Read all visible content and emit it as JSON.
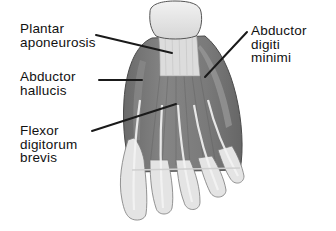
{
  "diagram": {
    "colors": {
      "muscle": "#7a7a7a",
      "muscle_dark": "#5e5e5e",
      "tendon": "#e6e6e6",
      "outline": "#4a4a4a",
      "leader_line": "#1a1a1a",
      "text": "#111111",
      "background": "#ffffff"
    },
    "labels": [
      {
        "id": "plantar-aponeurosis",
        "lines": [
          "Plantar",
          "aponeurosis"
        ],
        "x": 20,
        "y": 22,
        "pointer": {
          "x1": 96,
          "y1": 35,
          "x2": 172,
          "y2": 53
        }
      },
      {
        "id": "abductor-hallucis",
        "lines": [
          "Abductor",
          "hallucis"
        ],
        "x": 20,
        "y": 70,
        "pointer": {
          "x1": 99,
          "y1": 80,
          "x2": 142,
          "y2": 80
        }
      },
      {
        "id": "flexor-digitorum-brevis",
        "lines": [
          "Flexor",
          "digitorum",
          "brevis"
        ],
        "x": 20,
        "y": 125,
        "pointer": {
          "x1": 92,
          "y1": 131,
          "x2": 176,
          "y2": 104
        }
      },
      {
        "id": "abductor-digiti-minimi",
        "lines": [
          "Abductor",
          "digiti",
          "minimi"
        ],
        "x": 251,
        "y": 25,
        "pointer": {
          "x1": 247,
          "y1": 32,
          "x2": 205,
          "y2": 77
        }
      }
    ]
  }
}
